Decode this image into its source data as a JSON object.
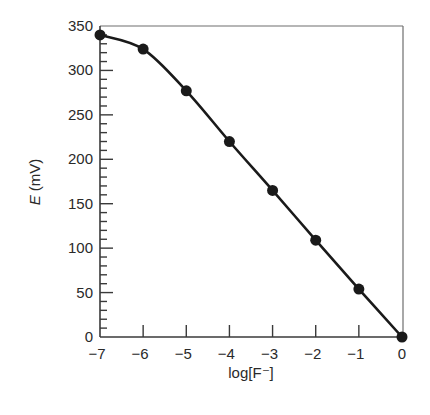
{
  "chart_data": {
    "type": "line",
    "title": "",
    "xlabel": "log[F⁻]",
    "ylabel_italic": "E",
    "ylabel_rest": " (mV)",
    "ylabel": "E (mV)",
    "xlim": [
      -7,
      0
    ],
    "ylim": [
      0,
      350
    ],
    "grid": false,
    "legend": null,
    "x_ticks": [
      -7,
      -6,
      -5,
      -4,
      -3,
      -2,
      -1,
      0
    ],
    "x_tick_labels": [
      "−7",
      "−6",
      "−5",
      "−4",
      "−3",
      "−2",
      "−1",
      "0"
    ],
    "y_ticks": [
      0,
      50,
      100,
      150,
      200,
      250,
      300,
      350
    ],
    "y_tick_labels": [
      "0",
      "50",
      "100",
      "150",
      "200",
      "250",
      "300",
      "350"
    ],
    "y_minor_tick_step": 10,
    "series": [
      {
        "name": "E vs log[F-]",
        "marker": "filled-circle",
        "line": "smooth",
        "color": "#1a1a1a",
        "x": [
          -7,
          -6,
          -5,
          -4,
          -3,
          -2,
          -1,
          0
        ],
        "y": [
          340,
          324,
          277,
          220,
          165,
          109,
          54,
          0
        ]
      }
    ]
  }
}
